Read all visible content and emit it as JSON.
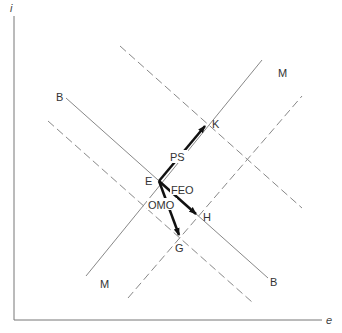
{
  "diagram": {
    "axes": {
      "y_label": "i",
      "x_label": "e"
    },
    "curves": {
      "bb_solid_label_top": "B",
      "bb_solid_label_bottom": "B",
      "mm_solid_label_top": "M",
      "mm_solid_label_bottom": "M"
    },
    "points": {
      "e": "E",
      "k": "K",
      "h": "H",
      "g": "G"
    },
    "arrows": {
      "ps": "PS",
      "feo": "FEO",
      "omo": "OMO"
    },
    "colors": {
      "line": "#777777",
      "arrow": "#111111",
      "text": "#333333"
    }
  }
}
